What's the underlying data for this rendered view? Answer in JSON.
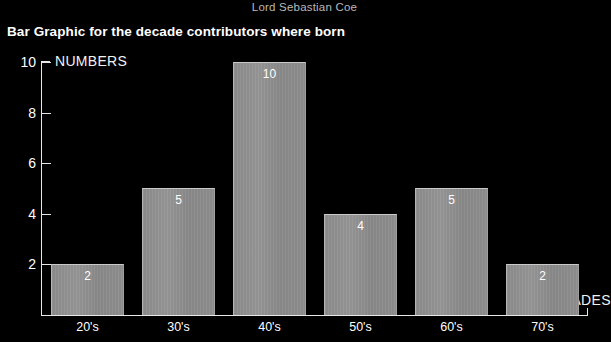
{
  "header": {
    "name": "Lord Sebastian Coe"
  },
  "title": "Bar Graphic for the decade contributors where born",
  "colors": {
    "background": "#000000",
    "bar_fill": "#8f8f8f",
    "bar_highlight": "#c9c9c9",
    "axis": "#e8e8e8",
    "text": "#ffffff",
    "header_text": "#b9b9b9"
  },
  "chart_data": {
    "type": "bar",
    "title": "Bar Graphic for the decade contributors where born",
    "subtitle": "Lord Sebastian Coe",
    "categories": [
      "20's",
      "30's",
      "40's",
      "50's",
      "60's",
      "70's"
    ],
    "values": [
      2,
      5,
      10,
      4,
      5,
      2
    ],
    "data_labels": [
      "2",
      "5",
      "10",
      "4",
      "5",
      "2"
    ],
    "xlabel": "DECADES",
    "ylabel": "NUMBERS",
    "ylim": [
      0,
      10
    ],
    "xlim_note": "categorical",
    "y_ticks": [
      2,
      4,
      6,
      8,
      10
    ],
    "y_tick_labels": [
      "2",
      "4",
      "6",
      "8",
      "10"
    ],
    "grid": false,
    "legend": false,
    "legend_position": "none",
    "orientation": "vertical"
  }
}
